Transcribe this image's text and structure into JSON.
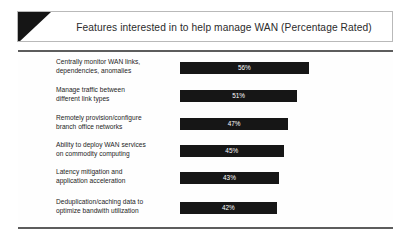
{
  "header": {
    "title": "Features interested in to help manage WAN (Percentage Rated)",
    "triangle_color": "#151515",
    "border_color": "#b9b9b9"
  },
  "rules": {
    "color": "#5d5d5d"
  },
  "chart_data": {
    "type": "bar",
    "orientation": "horizontal",
    "title": "Features interested in to help manage WAN (Percentage Rated)",
    "xlabel": "",
    "ylabel": "",
    "xlim": [
      0,
      75
    ],
    "grid": false,
    "legend": null,
    "bar_color": "#161616",
    "value_label_color": "#ffffff",
    "value_suffix": "%",
    "categories": [
      "Centrally monitor WAN links, dependencies, anomalies",
      "Manage traffic between different link types",
      "Remotely provision/configure branch office networks",
      "Ability to deploy WAN services on commodity computing",
      "Latency mitigation and application acceleration",
      "Deduplication/caching data to optimize bandwith utilization"
    ],
    "category_lines": [
      [
        "Centrally monitor WAN links,",
        "dependencies, anomalies"
      ],
      [
        "Manage traffic between",
        "different link types"
      ],
      [
        "Remotely provision/configure",
        "branch office networks"
      ],
      [
        "Ability to deploy WAN services",
        "on commodity computing"
      ],
      [
        "Latency mitigation and",
        "application acceleration"
      ],
      [
        "Deduplication/caching data to",
        "optimize bandwith utilization"
      ]
    ],
    "values": [
      56,
      51,
      47,
      45,
      43,
      42
    ],
    "value_labels": [
      "56%",
      "51%",
      "47%",
      "45%",
      "43%",
      "42%"
    ]
  }
}
